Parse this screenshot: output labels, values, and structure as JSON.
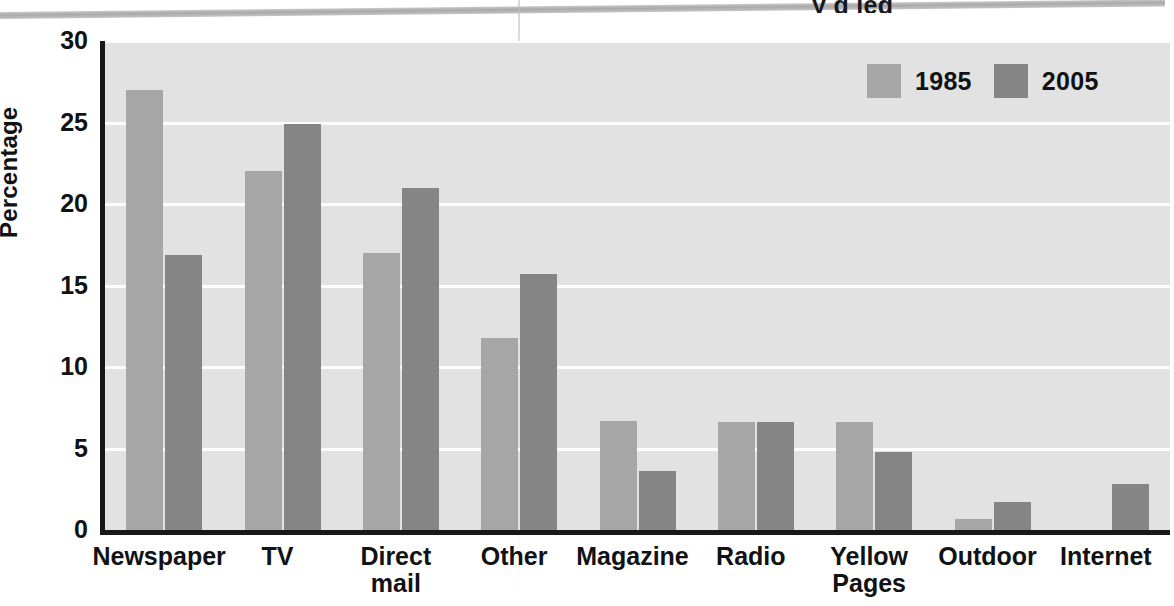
{
  "page": {
    "title_fragment": "y g  leg",
    "rule_label": "horizontal-rule"
  },
  "chart_data": {
    "type": "bar",
    "title": "",
    "xlabel": "",
    "ylabel": "Percentage",
    "ylim": [
      0,
      30
    ],
    "yticks": [
      0,
      5,
      10,
      15,
      20,
      25,
      30
    ],
    "grid": true,
    "legend_position": "top-right",
    "categories": [
      "Newspaper",
      "TV",
      "Direct\nmail",
      "Other",
      "Magazine",
      "Radio",
      "Yellow\nPages",
      "Outdoor",
      "Internet"
    ],
    "series": [
      {
        "name": "1985",
        "color": "#a6a6a6",
        "values": [
          27.0,
          22.0,
          17.0,
          11.8,
          6.7,
          6.6,
          6.6,
          0.7,
          0.0
        ]
      },
      {
        "name": "2005",
        "color": "#858585",
        "values": [
          16.9,
          24.9,
          21.0,
          15.7,
          3.6,
          6.6,
          4.8,
          1.7,
          2.8
        ]
      }
    ]
  },
  "colors": {
    "plot_background": "#e2e2e2",
    "axis": "#16181a",
    "gridline": "#fdfdfd",
    "series_1985": "#a6a6a6",
    "series_2005": "#858585",
    "text": "#101214"
  }
}
